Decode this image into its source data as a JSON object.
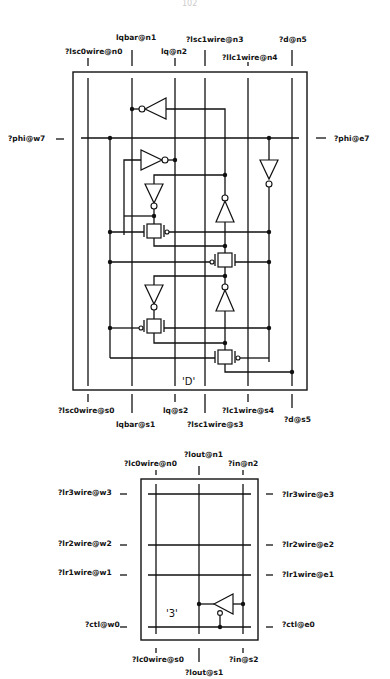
{
  "page": {
    "number": "102"
  },
  "cell_d": {
    "name": "'D'",
    "top_pins": [
      {
        "label": "?lsc0wire@n0",
        "x": 88
      },
      {
        "label": "lqbar@n1",
        "x": 132
      },
      {
        "label": "lq@n2",
        "x": 175
      },
      {
        "label": "?lsc1wire@n3",
        "x": 205
      },
      {
        "label": "?llc1wire@n4",
        "x": 248
      },
      {
        "label": "?d@n5",
        "x": 292
      }
    ],
    "bottom_pins": [
      {
        "label": "?lsc0wire@s0",
        "x": 88
      },
      {
        "label": "lqbar@s1",
        "x": 132
      },
      {
        "label": "lq@s2",
        "x": 175
      },
      {
        "label": "?lsc1wire@s3",
        "x": 205
      },
      {
        "label": "?lc1wire@s4",
        "x": 248
      },
      {
        "label": "?d@s5",
        "x": 292
      }
    ],
    "west_pins": [
      {
        "label": "?phi@w7"
      }
    ],
    "east_pins": [
      {
        "label": "?phi@e7"
      }
    ]
  },
  "cell_3": {
    "name": "'3'",
    "top_pins": [
      {
        "label": "?lc0wire@n0",
        "x": 156
      },
      {
        "label": "?lout@n1",
        "x": 199
      },
      {
        "label": "?in@n2",
        "x": 243
      }
    ],
    "bottom_pins": [
      {
        "label": "?lc0wire@s0",
        "x": 156
      },
      {
        "label": "?lout@s1",
        "x": 199
      },
      {
        "label": "?in@s2",
        "x": 243
      }
    ],
    "west_pins": [
      {
        "label": "?lr3wire@w3"
      },
      {
        "label": "?lr2wire@w2"
      },
      {
        "label": "?lr1wire@w1"
      },
      {
        "label": "?ctl@w0"
      }
    ],
    "east_pins": [
      {
        "label": "?lr3wire@e3"
      },
      {
        "label": "?lr2wire@e2"
      },
      {
        "label": "?lr1wire@e1"
      },
      {
        "label": "?ctl@e0"
      }
    ]
  }
}
